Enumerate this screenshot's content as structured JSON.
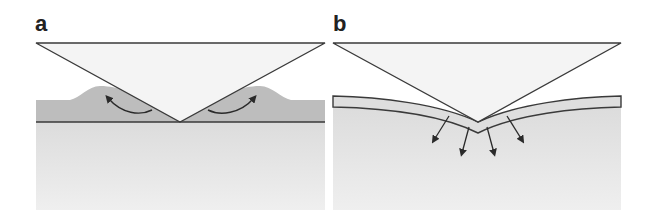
{
  "figure": {
    "panels": [
      {
        "label": "a",
        "description": "Indentation of bulk material with pile-up around rigid conical indenter",
        "elements": [
          "indenter-triangle",
          "pile-up-region",
          "substrate",
          "surface-line",
          "flow-arrows-up"
        ]
      },
      {
        "label": "b",
        "description": "Indentation of thin film on substrate showing sink-in and stress transfer into substrate",
        "elements": [
          "indenter-triangle",
          "bent-film-layer",
          "substrate",
          "stress-arrows-down"
        ]
      }
    ],
    "colors": {
      "indenter_fill": "#f3f3f3",
      "outline": "#3a3a3a",
      "pileup_fill": "#b9b9b9",
      "substrate_fill": "#e4e4e4",
      "film_fill": "#dcdcdc",
      "arrow": "#2a2a2a"
    }
  }
}
